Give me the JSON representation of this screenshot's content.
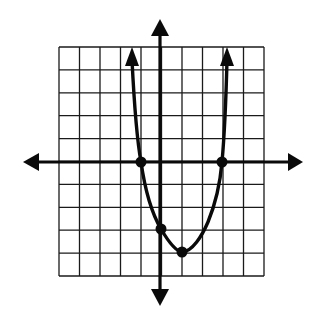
{
  "figure": {
    "type": "coordinate-plane-graph",
    "grid": {
      "columns": 10,
      "rows": 10,
      "x_range": [
        -5,
        5
      ],
      "y_range": [
        -5,
        5
      ],
      "unit": 1
    },
    "axes": {
      "x_axis_arrows": true,
      "y_axis_arrows": true,
      "tick_labels": "none"
    },
    "colors": {
      "ink": "#0a0a0a",
      "grid": "#1a1a1a",
      "background": "#ffffff"
    }
  },
  "chart_data": {
    "type": "line",
    "title": "",
    "xlabel": "",
    "ylabel": "",
    "xlim": [
      -5,
      5
    ],
    "ylim": [
      -5,
      5
    ],
    "grid": true,
    "series": [
      {
        "name": "parabola",
        "equation": "y = x^2 - 2x - 3",
        "end_arrows": true
      }
    ],
    "points": [
      {
        "label": "x-intercept",
        "x": -1,
        "y": 0
      },
      {
        "label": "x-intercept",
        "x": 3,
        "y": 0
      },
      {
        "label": "y-intercept",
        "x": 0,
        "y": -3
      },
      {
        "label": "vertex",
        "x": 1,
        "y": -4
      }
    ]
  }
}
